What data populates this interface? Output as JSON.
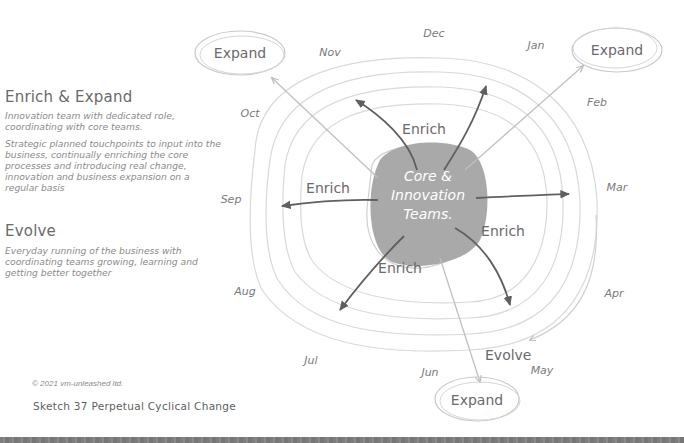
{
  "sidebar": {
    "sections": [
      {
        "title": "Enrich & Expand",
        "description_1": "Innovation team with dedicated role, coordinating with core teams.",
        "description_2": "Strategic planned touchpoints to input into the business, continually enriching the core processes and introducing real change, innovation and business expansion on a regular basis"
      },
      {
        "title": "Evolve",
        "description_1": "Everyday running of the business with coordinating teams growing, learning and getting better together"
      }
    ],
    "copyright": "© 2021 vm-unleashed ltd.",
    "caption": "Sketch 37  Perpetual Cyclical Change"
  },
  "diagram": {
    "core": {
      "line1": "Core &",
      "line2": "Innovation",
      "line3": "Teams.",
      "fill": "#a9a9a9"
    },
    "months": [
      "Jan",
      "Feb",
      "Mar",
      "Apr",
      "May",
      "Jun",
      "Jul",
      "Aug",
      "Sep",
      "Oct",
      "Nov",
      "Dec"
    ],
    "enrich_labels": [
      "Enrich",
      "Enrich",
      "Enrich",
      "Enrich"
    ],
    "expand_labels": [
      "Expand",
      "Expand",
      "Expand"
    ],
    "evolve_label": "Evolve",
    "colors": {
      "ring": "#d6d6d6",
      "dark_arrow": "#5f5f5f",
      "light_arrow": "#bdbdbd",
      "text": "#6a6a6a"
    }
  }
}
